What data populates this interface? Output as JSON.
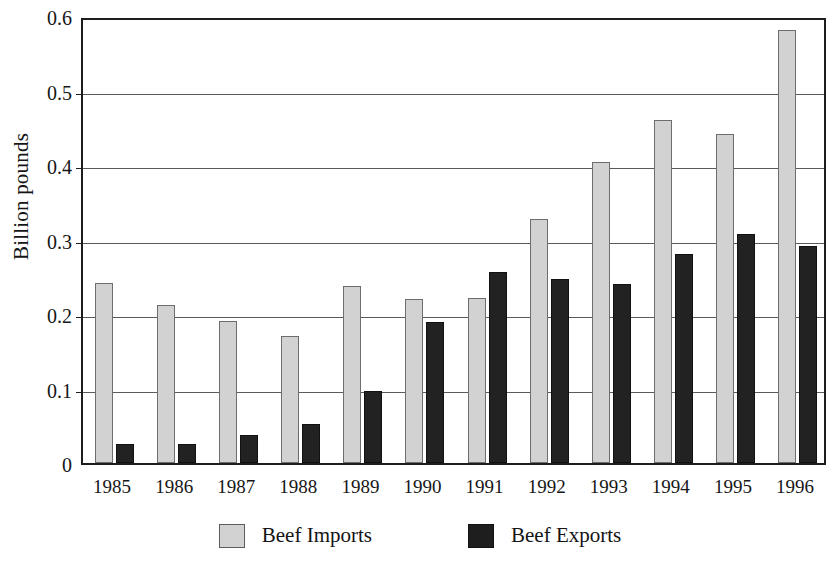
{
  "chart_data": {
    "type": "bar",
    "title": "",
    "xlabel": "",
    "ylabel": "Billion pounds",
    "ylim": [
      0,
      0.6
    ],
    "ytick_labels": [
      "0.6",
      "0.5",
      "0.4",
      "0.3",
      "0.2",
      "0.1",
      "0"
    ],
    "ytick_values": [
      0.6,
      0.5,
      0.4,
      0.3,
      0.2,
      0.1,
      0
    ],
    "grid": true,
    "legend_position": "bottom",
    "categories": [
      "1985",
      "1986",
      "1987",
      "1988",
      "1989",
      "1990",
      "1991",
      "1992",
      "1993",
      "1994",
      "1995",
      "1996"
    ],
    "series": [
      {
        "name": "Beef Imports",
        "color": "#d2d2d2",
        "values": [
          0.241,
          0.212,
          0.19,
          0.171,
          0.237,
          0.22,
          0.221,
          0.328,
          0.404,
          0.46,
          0.441,
          0.581
        ]
      },
      {
        "name": "Beef Exports",
        "color": "#222222",
        "values": [
          0.026,
          0.025,
          0.037,
          0.052,
          0.097,
          0.189,
          0.257,
          0.247,
          0.24,
          0.281,
          0.308,
          0.291
        ]
      }
    ]
  },
  "legend": {
    "items": [
      {
        "label": "Beef Imports",
        "swatch": "imports"
      },
      {
        "label": "Beef Exports",
        "swatch": "exports"
      }
    ]
  }
}
